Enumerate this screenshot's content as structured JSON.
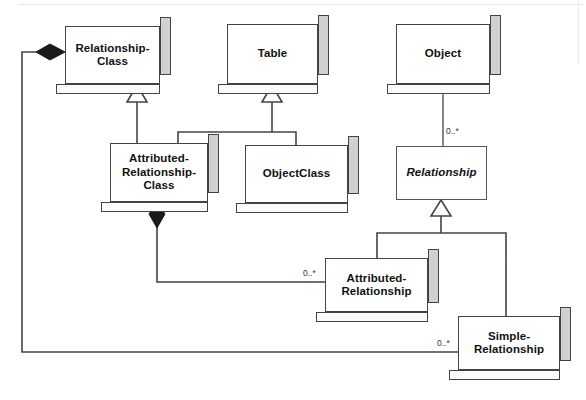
{
  "diagram": {
    "type": "uml-class-diagram",
    "width": 586,
    "height": 400,
    "background_color": "#ffffff",
    "line_color": "#444444",
    "shadow_color": "#d0d0d0",
    "text_color": "#111111"
  },
  "nodes": {
    "relationship_class": {
      "label": "Relationship-\nClass",
      "style": "3d",
      "x": 65,
      "y": 26,
      "w": 95,
      "h": 58
    },
    "table": {
      "label": "Table",
      "style": "3d",
      "x": 227,
      "y": 24,
      "w": 91,
      "h": 60
    },
    "object": {
      "label": "Object",
      "style": "3d",
      "x": 396,
      "y": 24,
      "w": 94,
      "h": 60
    },
    "attributed_relationship_class": {
      "label": "Attributed-\nRelationship-\nClass",
      "style": "3d",
      "x": 110,
      "y": 143,
      "w": 98,
      "h": 59
    },
    "object_class": {
      "label": "ObjectClass",
      "style": "3d",
      "x": 245,
      "y": 145,
      "w": 103,
      "h": 58
    },
    "relationship": {
      "label": "Relationship",
      "style": "flat-abstract",
      "x": 396,
      "y": 146,
      "w": 91,
      "h": 54
    },
    "attributed_relationship": {
      "label": "Attributed-\nRelationship",
      "style": "3d",
      "x": 325,
      "y": 258,
      "w": 103,
      "h": 54
    },
    "simple_relationship": {
      "label": "Simple-\nRelationship",
      "style": "3d",
      "x": 458,
      "y": 316,
      "w": 102,
      "h": 54
    }
  },
  "multiplicities": {
    "object_relationship": "0..*",
    "attributed_relationship": "0..*",
    "simple_relationship": "0..*"
  },
  "relations": [
    {
      "name": "generalization-arc-class",
      "kind": "generalization",
      "from": "attributed_relationship_class",
      "to": "relationship_class"
    },
    {
      "name": "generalization-arc-table",
      "kind": "generalization",
      "from": [
        "attributed_relationship_class",
        "object_class"
      ],
      "to": "table"
    },
    {
      "name": "association-object-relationship",
      "kind": "association",
      "from": "object",
      "to": "relationship",
      "multiplicity": "0..*"
    },
    {
      "name": "generalization-arc-relationship",
      "kind": "generalization",
      "from": [
        "attributed_relationship",
        "simple_relationship"
      ],
      "to": "relationship"
    },
    {
      "name": "composition-arc-class",
      "kind": "composition",
      "from": "relationship_class",
      "to": "simple_relationship",
      "multiplicity": "0..*"
    },
    {
      "name": "composition-arc-attributed",
      "kind": "composition",
      "from": "attributed_relationship_class",
      "to": "attributed_relationship",
      "multiplicity": "0..*"
    }
  ]
}
